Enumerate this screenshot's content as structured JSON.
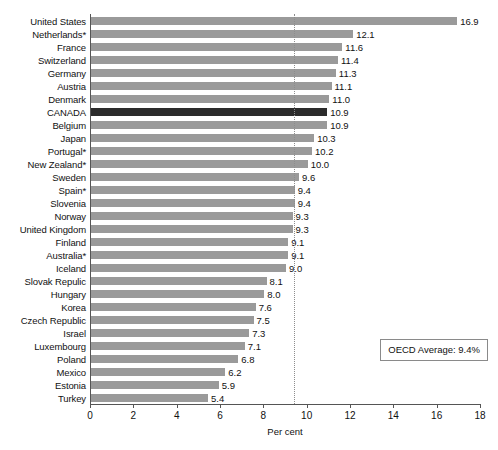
{
  "chart_data": {
    "type": "bar",
    "orientation": "horizontal",
    "title": "",
    "xlabel": "Per cent",
    "ylabel": "",
    "xlim": [
      0,
      18
    ],
    "xticks": [
      0,
      2,
      4,
      6,
      8,
      10,
      12,
      14,
      16,
      18
    ],
    "grid": false,
    "legend": null,
    "categories": [
      "United States",
      "Netherlands*",
      "France",
      "Switzerland",
      "Germany",
      "Austria",
      "Denmark",
      "CANADA",
      "Belgium",
      "Japan",
      "Portugal*",
      "New Zealand*",
      "Sweden",
      "Spain*",
      "Slovenia",
      "Norway",
      "United Kingdom",
      "Finland",
      "Australia*",
      "Iceland",
      "Slovak Repulic",
      "Hungary",
      "Korea",
      "Czech Republic",
      "Israel",
      "Luxembourg",
      "Poland",
      "Mexico",
      "Estonia",
      "Turkey"
    ],
    "values": [
      16.9,
      12.1,
      11.6,
      11.4,
      11.3,
      11.1,
      11.0,
      10.9,
      10.9,
      10.3,
      10.2,
      10.0,
      9.6,
      9.4,
      9.4,
      9.3,
      9.3,
      9.1,
      9.1,
      9.0,
      8.1,
      8.0,
      7.6,
      7.5,
      7.3,
      7.1,
      6.8,
      6.2,
      5.9,
      5.4
    ],
    "value_labels": [
      "16.9",
      "12.1",
      "11.6",
      "11.4",
      "11.3",
      "11.1",
      "11.0",
      "10.9",
      "10.9",
      "10.3",
      "10.2",
      "10.0",
      "9.6",
      "9.4",
      "9.4",
      "9.3",
      "9.3",
      "9.1",
      "9.1",
      "9.0",
      "8.1",
      "8.0",
      "7.6",
      "7.5",
      "7.3",
      "7.1",
      "6.8",
      "6.2",
      "5.9",
      "5.4"
    ],
    "highlight_category": "CANADA",
    "annotations": [
      {
        "name": "oecd-average",
        "label": "OECD Average: 9.4%",
        "value": 9.4,
        "line_style": "dotted"
      }
    ],
    "colors": {
      "bar": "#9a9a9a",
      "bar_highlight": "#2b2b2b",
      "axis": "#555555",
      "reference_line": "#8d8d8d",
      "text": "#111111"
    }
  }
}
